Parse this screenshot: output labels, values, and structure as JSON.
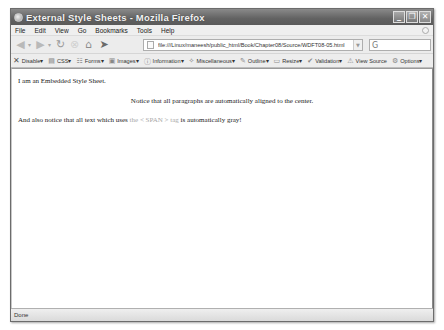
{
  "window": {
    "title": "External Style Sheets - Mozilla Firefox",
    "controls": {
      "minimize": "_",
      "restore": "❐",
      "close": "✕"
    }
  },
  "menubar": {
    "items": [
      {
        "label": "File"
      },
      {
        "label": "Edit"
      },
      {
        "label": "View"
      },
      {
        "label": "Go"
      },
      {
        "label": "Bookmarks"
      },
      {
        "label": "Tools"
      },
      {
        "label": "Help"
      }
    ]
  },
  "navbar": {
    "back_glyph": "◀",
    "forward_glyph": "▶",
    "dropdown_glyph": "▾",
    "reload_glyph": "↻",
    "stop_glyph": "⊗",
    "home_glyph": "⌂",
    "gesture_glyph": "➤",
    "url": "file:///Linux/maneesh/public_html/Book/Chapter08/Source/WDFT08-05.html",
    "url_dropdown_glyph": "▼",
    "search_glyph": "G",
    "search_value": ""
  },
  "devbar": {
    "items": [
      {
        "icon": "✕",
        "label": "Disable▾",
        "name": "disable"
      },
      {
        "icon": "▤",
        "label": "CSS▾",
        "name": "css"
      },
      {
        "icon": "☷",
        "label": "Forms▾",
        "name": "forms"
      },
      {
        "icon": "▣",
        "label": "Images▾",
        "name": "images"
      },
      {
        "icon": "ⓘ",
        "label": "Information▾",
        "name": "information"
      },
      {
        "icon": "✧",
        "label": "Miscellaneous▾",
        "name": "miscellaneous"
      },
      {
        "icon": "✎",
        "label": "Outline▾",
        "name": "outline"
      },
      {
        "icon": "▭",
        "label": "Resize▾",
        "name": "resize"
      },
      {
        "icon": "✔",
        "label": "Validation▾",
        "name": "validation"
      },
      {
        "icon": "⚠",
        "label": "View Source",
        "name": "view-source"
      },
      {
        "icon": "⚙",
        "label": "Options▾",
        "name": "options"
      }
    ]
  },
  "content": {
    "paragraph1": "I am an Embedded Style Sheet.",
    "paragraph2": "Notice that all paragraphs are automatically aligned to the center.",
    "paragraph3_before": "And also notice that all text which uses ",
    "paragraph3_span": "the < SPAN > tag",
    "paragraph3_after": " is automatically gray!",
    "span_color": "#a8a8a8"
  },
  "statusbar": {
    "text": "Done"
  }
}
